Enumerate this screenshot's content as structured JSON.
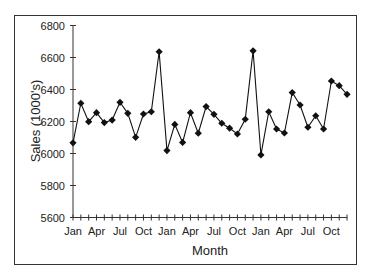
{
  "chart_data": {
    "type": "line",
    "title": "",
    "xlabel": "Month",
    "ylabel": "Sales (1000's)",
    "ylim": [
      5600,
      6800
    ],
    "yticks": [
      5600,
      5800,
      6000,
      6200,
      6400,
      6600,
      6800
    ],
    "x": [
      "Jan",
      "Feb",
      "Mar",
      "Apr",
      "May",
      "Jun",
      "Jul",
      "Aug",
      "Sep",
      "Oct",
      "Nov",
      "Dec",
      "Jan",
      "Feb",
      "Mar",
      "Apr",
      "May",
      "Jun",
      "Jul",
      "Aug",
      "Sep",
      "Oct",
      "Nov",
      "Dec",
      "Jan",
      "Feb",
      "Mar",
      "Apr",
      "May",
      "Jun",
      "Jul",
      "Aug",
      "Sep",
      "Oct",
      "Nov",
      "Dec"
    ],
    "xtick_labels": [
      "Jan",
      "Apr",
      "Jul",
      "Oct",
      "Jan",
      "Apr",
      "Jul",
      "Oct",
      "Jan",
      "Apr",
      "Jul",
      "Oct"
    ],
    "grid": false,
    "legend": "none",
    "marker": "diamond",
    "series": [
      {
        "name": "Sales",
        "color": "#111111",
        "values": [
          6067,
          6314,
          6199,
          6255,
          6193,
          6209,
          6320,
          6251,
          6101,
          6247,
          6261,
          6636,
          6018,
          6182,
          6069,
          6255,
          6127,
          6293,
          6245,
          6189,
          6158,
          6122,
          6214,
          6642,
          5991,
          6261,
          6153,
          6128,
          6381,
          6303,
          6164,
          6236,
          6153,
          6453,
          6424,
          6370
        ]
      }
    ]
  }
}
